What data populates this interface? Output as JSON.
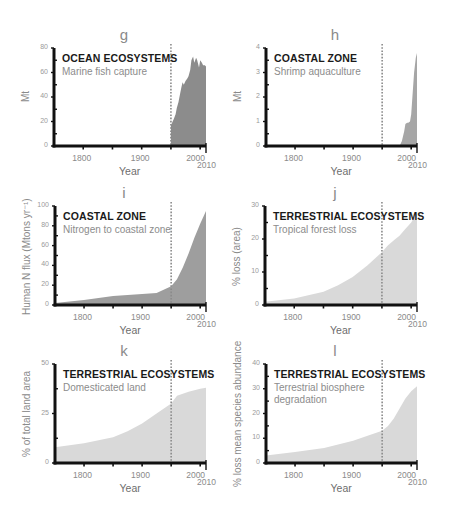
{
  "chart_data": [
    {
      "panel": "g",
      "type": "area",
      "title": "OCEAN ECOSYSTEMS",
      "subtitle": "Marine fish capture",
      "xlabel": "Year",
      "ylabel": "Mt",
      "xlim": [
        1750,
        2010
      ],
      "ylim": [
        0,
        80
      ],
      "yticks": [
        0,
        20,
        40,
        60,
        80
      ],
      "xticks": [
        "1800",
        "1900",
        "2000",
        "2010"
      ],
      "marker_year": 1950,
      "color": "#8c8c8c",
      "x": [
        1950,
        1952,
        1955,
        1958,
        1960,
        1963,
        1965,
        1968,
        1970,
        1972,
        1975,
        1978,
        1980,
        1983,
        1985,
        1988,
        1990,
        1993,
        1995,
        1998,
        2000,
        2003,
        2005,
        2008,
        2010
      ],
      "values": [
        17,
        19,
        22,
        26,
        31,
        36,
        41,
        48,
        52,
        50,
        53,
        55,
        57,
        62,
        70,
        73,
        68,
        72,
        70,
        64,
        70,
        68,
        66,
        66,
        65
      ]
    },
    {
      "panel": "h",
      "type": "area",
      "title": "COASTAL ZONE",
      "subtitle": "Shrimp aquaculture",
      "xlabel": "Year",
      "ylabel": "Mt",
      "xlim": [
        1750,
        2010
      ],
      "ylim": [
        0,
        4
      ],
      "yticks": [
        0,
        1,
        2,
        3,
        4
      ],
      "xticks": [
        "1800",
        "1900",
        "2000",
        "2010"
      ],
      "marker_year": 1950,
      "color": "#a6a6a6",
      "x": [
        1950,
        1980,
        1984,
        1988,
        1990,
        1993,
        1995,
        1998,
        2000,
        2003,
        2005,
        2008,
        2010
      ],
      "values": [
        0,
        0,
        0.2,
        0.6,
        0.9,
        0.95,
        0.95,
        1.0,
        1.3,
        2.3,
        3.0,
        3.6,
        3.8
      ]
    },
    {
      "panel": "i",
      "type": "area",
      "title": "COASTAL ZONE",
      "subtitle": "Nitrogen to coastal zone",
      "xlabel": "Year",
      "ylabel": "Human N flux (Mtons yr⁻¹)",
      "xlim": [
        1750,
        2010
      ],
      "ylim": [
        0,
        100
      ],
      "yticks": [
        0,
        20,
        40,
        60,
        80,
        100
      ],
      "xticks": [
        "1800",
        "1900",
        "2000",
        "2010"
      ],
      "marker_year": 1950,
      "color": "#9e9e9e",
      "x": [
        1750,
        1800,
        1850,
        1900,
        1925,
        1950,
        1960,
        1970,
        1980,
        1990,
        2000,
        2010
      ],
      "values": [
        2,
        5,
        9,
        11,
        12,
        19,
        26,
        38,
        52,
        68,
        82,
        95
      ]
    },
    {
      "panel": "j",
      "type": "area",
      "title": "TERRESTRIAL ECOSYSTEMS",
      "subtitle": "Tropical forest loss",
      "xlabel": "Year",
      "ylabel": "% loss (area)",
      "xlim": [
        1750,
        2010
      ],
      "ylim": [
        0,
        30
      ],
      "yticks": [
        0,
        10,
        20,
        30
      ],
      "xticks": [
        "1800",
        "1900",
        "2000",
        "2010"
      ],
      "marker_year": 1950,
      "color": "#d9d9d9",
      "x": [
        1750,
        1800,
        1850,
        1875,
        1900,
        1925,
        1950,
        1960,
        1970,
        1980,
        1990,
        2000,
        2010
      ],
      "values": [
        1,
        2,
        4,
        6,
        8.5,
        12,
        16,
        18,
        19.5,
        21,
        23,
        25,
        28
      ]
    },
    {
      "panel": "k",
      "type": "area",
      "title": "TERRESTRIAL ECOSYSTEMS",
      "subtitle": "Domesticated land",
      "xlabel": "Year",
      "ylabel": "% of total land area",
      "xlim": [
        1750,
        2010
      ],
      "ylim": [
        0,
        50
      ],
      "yticks": [
        0,
        25,
        50
      ],
      "xticks": [
        "1800",
        "1900",
        "2000",
        "2010"
      ],
      "marker_year": 1950,
      "color": "#d9d9d9",
      "x": [
        1750,
        1800,
        1850,
        1875,
        1900,
        1925,
        1950,
        1960,
        1980,
        2000,
        2010
      ],
      "values": [
        8,
        10,
        13,
        16,
        20,
        25,
        30,
        34,
        36,
        37.5,
        38
      ]
    },
    {
      "panel": "l",
      "type": "area",
      "title": "TERRESTRIAL ECOSYSTEMS",
      "subtitle": "Terrestrial biosphere degradation",
      "xlabel": "Year",
      "ylabel": "% loss mean species abundance",
      "xlim": [
        1750,
        2010
      ],
      "ylim": [
        0,
        40
      ],
      "yticks": [
        0,
        10,
        20,
        30,
        40
      ],
      "xticks": [
        "1800",
        "1900",
        "2000",
        "2010"
      ],
      "marker_year": 1950,
      "color": "#d9d9d9",
      "x": [
        1750,
        1800,
        1850,
        1900,
        1925,
        1950,
        1960,
        1970,
        1980,
        1990,
        2000,
        2010
      ],
      "values": [
        3,
        4.5,
        6,
        9,
        11,
        13,
        15,
        18,
        22,
        26,
        29,
        31
      ]
    }
  ]
}
